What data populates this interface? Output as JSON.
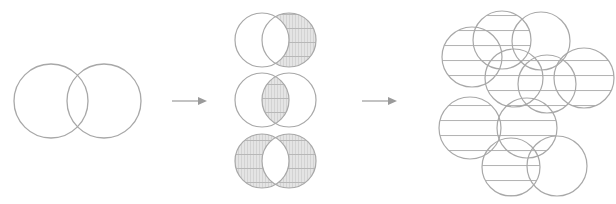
{
  "diagram": {
    "colors": {
      "stroke": "#a8a8a8",
      "fill": "#e6e6e6",
      "hatch": "#b8b8b8",
      "arrow": "#9a9a9a",
      "background": "#ffffff"
    },
    "stages": [
      {
        "name": "input-venn",
        "circles": [
          {
            "cx": 51,
            "cy": 101,
            "r": 37
          },
          {
            "cx": 104,
            "cy": 101,
            "r": 37
          }
        ]
      },
      {
        "name": "set-operations",
        "operations": [
          {
            "name": "difference",
            "region": "right-minus-left",
            "circles": [
              {
                "cx": 262,
                "cy": 40,
                "r": 27
              },
              {
                "cx": 289,
                "cy": 40,
                "r": 27
              }
            ]
          },
          {
            "name": "intersection",
            "region": "lens",
            "circles": [
              {
                "cx": 262,
                "cy": 100,
                "r": 27
              },
              {
                "cx": 289,
                "cy": 100,
                "r": 27
              }
            ]
          },
          {
            "name": "symmetric-difference",
            "region": "xor",
            "circles": [
              {
                "cx": 262,
                "cy": 161,
                "r": 27
              },
              {
                "cx": 289,
                "cy": 161,
                "r": 27
              }
            ]
          }
        ]
      },
      {
        "name": "circle-cluster",
        "circles": [
          {
            "cx": 472,
            "cy": 57,
            "r": 30,
            "hatched": true
          },
          {
            "cx": 502,
            "cy": 40,
            "r": 29,
            "hatched": true
          },
          {
            "cx": 541,
            "cy": 41,
            "r": 29,
            "hatched": false
          },
          {
            "cx": 514,
            "cy": 78,
            "r": 29,
            "hatched": true
          },
          {
            "cx": 547,
            "cy": 84,
            "r": 29,
            "hatched": true
          },
          {
            "cx": 584,
            "cy": 78,
            "r": 30,
            "hatched": true
          },
          {
            "cx": 470,
            "cy": 128,
            "r": 31,
            "hatched": true
          },
          {
            "cx": 527,
            "cy": 128,
            "r": 30,
            "hatched": true
          },
          {
            "cx": 511,
            "cy": 167,
            "r": 29,
            "hatched": true
          },
          {
            "cx": 557,
            "cy": 166,
            "r": 30,
            "hatched": false
          }
        ]
      }
    ],
    "arrows": [
      {
        "name": "arrow-1",
        "x1": 172,
        "y1": 101,
        "x2": 207,
        "y2": 101
      },
      {
        "name": "arrow-2",
        "x1": 362,
        "y1": 101,
        "x2": 397,
        "y2": 101
      }
    ]
  }
}
